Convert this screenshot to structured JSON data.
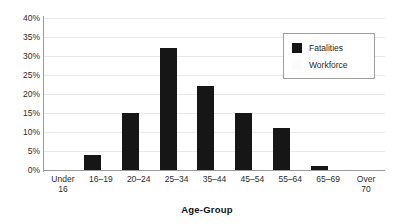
{
  "chart_data": {
    "type": "bar",
    "title": "",
    "xlabel": "Age-Group",
    "ylabel": "",
    "categories": [
      "Under 16",
      "16–19",
      "20–24",
      "25–34",
      "35–44",
      "45–54",
      "55–64",
      "65–69",
      "Over 70"
    ],
    "series": [
      {
        "name": "Fatalities",
        "color": "#161616",
        "values": [
          0,
          4,
          15,
          32,
          22,
          15,
          11,
          1,
          0
        ]
      },
      {
        "name": "Workforce",
        "color": "#f4f4f4",
        "values": [
          0,
          0,
          0,
          0,
          0,
          0,
          0,
          0,
          0
        ]
      }
    ],
    "ylim": [
      0,
      40
    ],
    "ytick_values": [
      0,
      5,
      10,
      15,
      20,
      25,
      30,
      35,
      40
    ],
    "ytick_labels": [
      "0%",
      "5%",
      "10%",
      "15%",
      "20%",
      "25%",
      "30%",
      "35%",
      "40%"
    ],
    "grid": true,
    "legend_position": "upper-right",
    "legend_entries": [
      {
        "label": "Fatalities",
        "swatch": "dark"
      },
      {
        "label": "Workforce",
        "swatch": "light"
      }
    ]
  }
}
